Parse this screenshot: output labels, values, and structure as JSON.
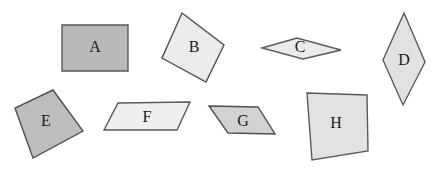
{
  "figure": {
    "background_color": "#ffffff",
    "width": 435,
    "height": 175,
    "default_stroke_color": "#595959",
    "default_stroke_width": 1.4,
    "label_color": "#1a1a1a",
    "label_font_size": 16
  },
  "shapes": [
    {
      "id": "shape-a",
      "label": "A",
      "kind": "rectangle",
      "fill": "#b9b9b9",
      "stroke": "#5a5a5a",
      "points": "62,25 128,25 128,71 62,71",
      "label_x": 95,
      "label_y": 48
    },
    {
      "id": "shape-b",
      "label": "B",
      "kind": "square-rotated",
      "fill": "#ebebeb",
      "stroke": "#4f4f4f",
      "points": "182,13 224,45 206,82 162,58",
      "label_x": 194,
      "label_y": 48
    },
    {
      "id": "shape-c",
      "label": "C",
      "kind": "rhombus-wide",
      "fill": "#ebebeb",
      "stroke": "#5a5a5a",
      "points": "262,48 297,38 341,50 303,59",
      "label_x": 300,
      "label_y": 48
    },
    {
      "id": "shape-d",
      "label": "D",
      "kind": "rhombus-tall",
      "fill": "#e2e2e2",
      "stroke": "#5a5a5a",
      "points": "404,13 425,62 403,105 383,60",
      "label_x": 404,
      "label_y": 61
    },
    {
      "id": "shape-e",
      "label": "E",
      "kind": "square-rotated",
      "fill": "#bdbdbd",
      "stroke": "#4f4f4f",
      "points": "53,90 83,131 33,158 15,108",
      "label_x": 46,
      "label_y": 122
    },
    {
      "id": "shape-f",
      "label": "F",
      "kind": "parallelogram",
      "fill": "#efefef",
      "stroke": "#5a5a5a",
      "points": "118,103 190,102 177,130 104,130",
      "label_x": 147,
      "label_y": 118
    },
    {
      "id": "shape-g",
      "label": "G",
      "kind": "parallelogram",
      "fill": "#d2d2d2",
      "stroke": "#4f4f4f",
      "points": "209,106 258,107 275,134 228,133",
      "label_x": 243,
      "label_y": 122
    },
    {
      "id": "shape-h",
      "label": "H",
      "kind": "quadrilateral-irregular",
      "fill": "#e2e2e2",
      "stroke": "#5a5a5a",
      "points": "307,93 367,95 368,151 312,160",
      "label_x": 336,
      "label_y": 124
    }
  ]
}
